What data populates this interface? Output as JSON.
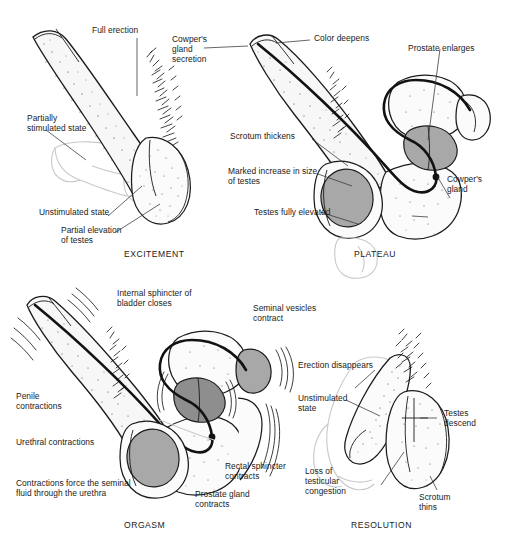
{
  "figure": {
    "background_color": "#ffffff",
    "label_color": "#1a1a1a",
    "leader_line_color": "#333333",
    "ghost_outline_color": "#c9c9c9",
    "organ_shade_color": "#a8a8a8"
  },
  "panels": [
    {
      "id": "excitement",
      "title": "EXCITEMENT",
      "labels": [
        {
          "name": "full-erection",
          "text": "Full erection"
        },
        {
          "name": "partially-stimulated-state",
          "text": "Partially\nstimulated state"
        },
        {
          "name": "unstimulated-state",
          "text": "Unstimulated state"
        },
        {
          "name": "partial-elevation-of-testes",
          "text": "Partial elevation\nof testes"
        }
      ]
    },
    {
      "id": "plateau",
      "title": "PLATEAU",
      "labels": [
        {
          "name": "cowpers-gland-secretion",
          "text": "Cowper's\ngland\nsecretion"
        },
        {
          "name": "color-deepens",
          "text": "Color deepens"
        },
        {
          "name": "prostate-enlarges",
          "text": "Prostate enlarges"
        },
        {
          "name": "scrotum-thickens",
          "text": "Scrotum thickens"
        },
        {
          "name": "marked-increase-in-size-of-testes",
          "text": "Marked increase in size\nof testes"
        },
        {
          "name": "testes-fully-elevated",
          "text": "Testes fully elevated"
        },
        {
          "name": "cowpers-gland",
          "text": "Cowper's\ngland"
        }
      ]
    },
    {
      "id": "orgasm",
      "title": "ORGASM",
      "labels": [
        {
          "name": "internal-sphincter-of-bladder-closes",
          "text": "Internal sphincter of\nbladder closes"
        },
        {
          "name": "seminal-vesicles-contract",
          "text": "Seminal vesicles\ncontract"
        },
        {
          "name": "penile-contractions",
          "text": "Penile\ncontractions"
        },
        {
          "name": "urethral-contractions",
          "text": "Urethral contractions"
        },
        {
          "name": "contractions-force-seminal-fluid",
          "text": "Contractions force the seminal\nfluid through the urethra"
        },
        {
          "name": "rectal-sphincter-contracts",
          "text": "Rectal sphincter\ncontracts"
        },
        {
          "name": "prostate-gland-contracts",
          "text": "Prostate gland\ncontracts"
        }
      ]
    },
    {
      "id": "resolution",
      "title": "RESOLUTION",
      "labels": [
        {
          "name": "erection-disappears",
          "text": "Erection disappears"
        },
        {
          "name": "unstimulated-state",
          "text": "Unstimulated\nstate"
        },
        {
          "name": "loss-of-testicular-congestion",
          "text": "Loss of\ntesticular\ncongestion"
        },
        {
          "name": "testes-descend",
          "text": "Testes\ndescend"
        },
        {
          "name": "scrotum-thins",
          "text": "Scrotum\nthins"
        }
      ]
    }
  ]
}
